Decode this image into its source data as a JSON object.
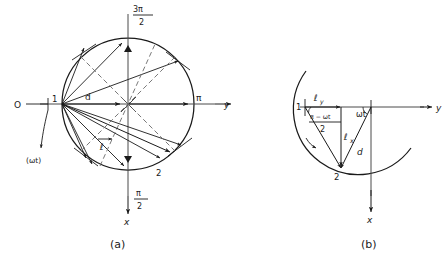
{
  "figure": {
    "panel_a": {
      "caption": "(a)",
      "origin_label": "O",
      "point_start_label": "1",
      "point_end_label": "2",
      "rotation_label": "(ωt)",
      "radius_label": "d",
      "vector_label": "ℓ",
      "axis_y_label": "y",
      "axis_x_label": "x",
      "angle_right_label": "π",
      "angle_top_numer": "3π",
      "angle_top_denom": "2",
      "angle_bottom_numer": "π",
      "angle_bottom_denom": "2"
    },
    "panel_b": {
      "caption": "(b)",
      "point_start_label": "1",
      "point_end_label": "2",
      "comp_y_label": "ℓ",
      "comp_y_sub": "y",
      "comp_x_label": "ℓ",
      "comp_x_sub": "x",
      "radius_label": "d",
      "angle_omega_label": "ωt",
      "angle_half_numer": "π − ωt",
      "angle_half_denom": "2",
      "axis_y_label": "y",
      "axis_x_label": "x"
    },
    "colors": {
      "ink": "#1a1a1a",
      "line": "#3a3a3a",
      "background": "#ffffff"
    }
  }
}
